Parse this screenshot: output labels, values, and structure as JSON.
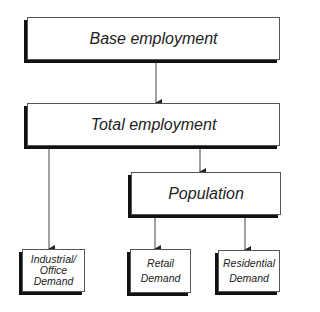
{
  "diagram": {
    "nodes": {
      "base_employment": {
        "label": "Base employment"
      },
      "total_employment": {
        "label": "Total employment"
      },
      "population": {
        "label": "Population"
      },
      "industrial_office_demand": {
        "lines": [
          "Industrial/",
          "Office",
          "Demand"
        ]
      },
      "retail_demand": {
        "lines": [
          "Retail",
          "Demand"
        ]
      },
      "residential_demand": {
        "lines": [
          "Residential",
          "Demand"
        ]
      }
    },
    "edges": [
      {
        "from": "Base employment",
        "to": "Total employment"
      },
      {
        "from": "Total employment",
        "to": "Industrial/Office Demand"
      },
      {
        "from": "Total employment",
        "to": "Population"
      },
      {
        "from": "Population",
        "to": "Retail Demand"
      },
      {
        "from": "Population",
        "to": "Residential Demand"
      }
    ],
    "colors": {
      "box_border": "#555555",
      "box_shadow": "#111111",
      "arrow": "#444444",
      "text": "#222222"
    }
  }
}
